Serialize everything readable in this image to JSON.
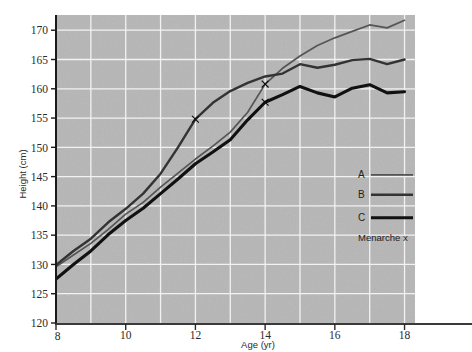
{
  "chart_data": {
    "type": "line",
    "title": "",
    "xlabel": "Age (yr)",
    "ylabel": "Height (cm)",
    "xlim": [
      8,
      18.3
    ],
    "ylim": [
      120,
      172.6
    ],
    "xticks": [
      8,
      10,
      12,
      14,
      16,
      18
    ],
    "xtick_labels": [
      "8",
      "10",
      "12",
      "14",
      "16",
      "18"
    ],
    "yticks": [
      120,
      125,
      130,
      135,
      140,
      145,
      150,
      155,
      160,
      165,
      170
    ],
    "ytick_labels": [
      "120",
      "125",
      "130",
      "135",
      "140",
      "145",
      "150",
      "155",
      "160",
      "165",
      "170"
    ],
    "grid": true,
    "grid_color": "#f2f2f2",
    "plot_background": "#b6b6b6",
    "legend_position": "lower-right",
    "legend_entries": [
      {
        "label": "A",
        "color": "#555555",
        "width": 1.7
      },
      {
        "label": "B",
        "color": "#333333",
        "width": 2.4
      },
      {
        "label": "C",
        "color": "#111111",
        "width": 3.1
      }
    ],
    "annotation": "Menarche x",
    "marker_symbol": "x",
    "x": [
      8,
      8.5,
      9,
      9.5,
      10,
      10.5,
      11,
      11.5,
      12,
      12.5,
      13,
      13.5,
      14,
      14.5,
      15,
      15.5,
      16,
      16.5,
      17,
      17.5,
      18
    ],
    "series": [
      {
        "name": "A",
        "color": "#555555",
        "width": 1.7,
        "values": [
          129.6,
          131.6,
          133.6,
          136.0,
          138.6,
          140.6,
          143.2,
          145.6,
          148.0,
          150.2,
          152.6,
          156.0,
          160.8,
          163.5,
          165.6,
          167.4,
          168.7,
          169.8,
          170.9,
          170.4,
          171.7
        ],
        "menarche": {
          "age": 14.0,
          "height": 160.8
        }
      },
      {
        "name": "B",
        "color": "#333333",
        "width": 2.4,
        "values": [
          129.9,
          132.3,
          134.4,
          137.2,
          139.5,
          142.1,
          145.5,
          150.0,
          154.8,
          157.6,
          159.6,
          161.0,
          162.1,
          162.6,
          164.2,
          163.6,
          164.1,
          164.9,
          165.1,
          164.2,
          165.0
        ],
        "menarche": {
          "age": 12.0,
          "height": 154.8
        }
      },
      {
        "name": "C",
        "color": "#111111",
        "width": 3.1,
        "values": [
          127.5,
          130.0,
          132.3,
          135.1,
          137.5,
          139.6,
          142.1,
          144.6,
          147.2,
          149.2,
          151.3,
          154.7,
          157.7,
          159.0,
          160.4,
          159.3,
          158.6,
          160.1,
          160.7,
          159.3,
          159.5
        ],
        "menarche": {
          "age": 14.0,
          "height": 157.7
        }
      }
    ]
  },
  "axes": {
    "x_title": "Age (yr)",
    "y_title": "Height (cm)"
  },
  "legend": {
    "items": [
      {
        "label": "A"
      },
      {
        "label": "B"
      },
      {
        "label": "C"
      }
    ],
    "note": "Menarche x"
  }
}
